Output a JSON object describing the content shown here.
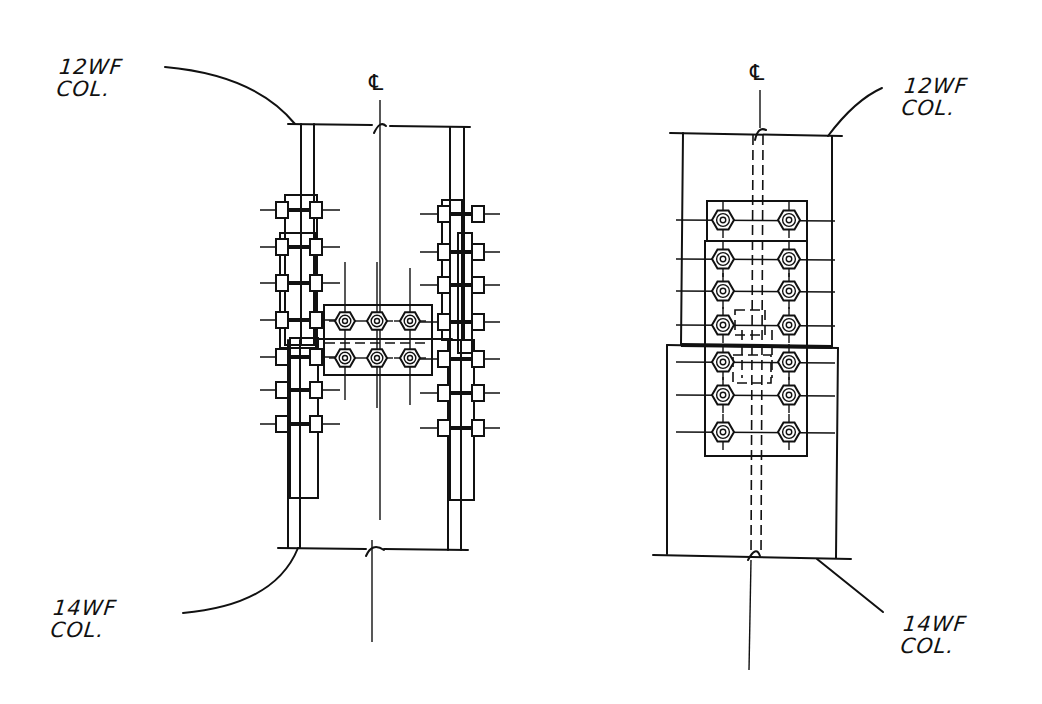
{
  "drawing": {
    "title": "Column splice details — elevation views",
    "left_view": {
      "centerline_symbol": "℄",
      "upper_label": {
        "line1": "12WF",
        "line2": "COL."
      },
      "lower_label": {
        "line1": "14WF",
        "line2": "COL."
      },
      "flange_bolt_rows": 7,
      "web_plate_bolts": {
        "rows": 2,
        "cols": 3
      }
    },
    "right_view": {
      "centerline_symbol": "℄",
      "upper_label": {
        "line1": "12WF",
        "line2": "COL."
      },
      "lower_label": {
        "line1": "14WF",
        "line2": "COL."
      },
      "splice_plate_bolts": {
        "rows": 7,
        "cols": 2
      }
    },
    "colors": {
      "ink": "#111111",
      "paper": "#ffffff"
    }
  }
}
